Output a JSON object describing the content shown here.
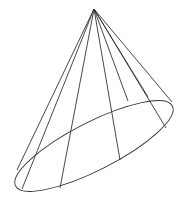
{
  "diagram": {
    "stroke_color": "#333333",
    "background": "#ffffff",
    "apex": [
      94,
      9
    ],
    "base_ellipse": {
      "cx": 94,
      "cy": 146,
      "rx": 88,
      "ry": 24,
      "rotation": -27
    },
    "generators": [
      [
        17,
        170
      ],
      [
        22,
        189
      ],
      [
        60,
        188
      ],
      [
        120,
        160
      ],
      [
        128,
        101
      ],
      [
        148,
        97
      ],
      [
        166,
        128
      ],
      [
        172,
        102
      ]
    ]
  }
}
